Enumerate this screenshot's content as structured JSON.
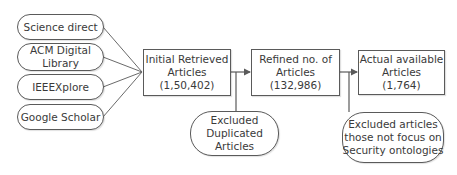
{
  "diagram": {
    "sources": [
      {
        "lines": [
          "Science direct"
        ]
      },
      {
        "lines": [
          "ACM Digital",
          "Library"
        ]
      },
      {
        "lines": [
          "IEEEXplore"
        ]
      },
      {
        "lines": [
          "Google Scholar"
        ]
      }
    ],
    "stages": [
      {
        "lines": [
          "Initial Retrieved",
          "Articles",
          "(1,50,402)"
        ]
      },
      {
        "lines": [
          "Refined no. of",
          "Articles",
          "(132,986)"
        ]
      },
      {
        "lines": [
          "Actual available",
          "Articles",
          "(1,764)"
        ]
      }
    ],
    "exclusions": [
      {
        "lines": [
          "Excluded",
          "Duplicated",
          "Articles"
        ]
      },
      {
        "lines": [
          "Excluded articles",
          "those not focus on",
          "Security ontologies"
        ]
      }
    ],
    "colors": {
      "stroke": "#5a5a5a",
      "text": "#3a3a3a",
      "background": "#ffffff"
    }
  }
}
